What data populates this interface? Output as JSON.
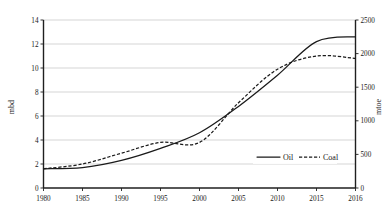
{
  "chart_data": {
    "type": "line",
    "title": "",
    "xlabel": "",
    "ylabel": "mbd",
    "y2label": "mtoe",
    "grid": true,
    "legend_position": "inside-right-lower",
    "x": [
      1980,
      1985,
      1990,
      1995,
      2000,
      2005,
      2010,
      2015,
      2016
    ],
    "xtick_labels": [
      "1980",
      "1985",
      "1990",
      "1995",
      "2000",
      "2005",
      "2010",
      "2015",
      "2016"
    ],
    "xlim": [
      1980,
      2016
    ],
    "ylim": [
      0,
      14
    ],
    "ytick_labels": [
      "0",
      "2",
      "4",
      "6",
      "8",
      "10",
      "12",
      "14"
    ],
    "ytick_values": [
      0,
      2,
      4,
      6,
      8,
      10,
      12,
      14
    ],
    "y2lim": [
      0,
      2500
    ],
    "y2tick_labels": [
      "0",
      "500",
      "1000",
      "1500",
      "2000",
      "2500"
    ],
    "y2tick_values": [
      0,
      500,
      1000,
      1500,
      2000,
      2500
    ],
    "series": [
      {
        "name": "Oil",
        "axis": "left",
        "unit": "mbd",
        "style": "solid",
        "color": "#1a1a1a",
        "x": [
          1980,
          1985,
          1990,
          1995,
          2000,
          2005,
          2010,
          2015,
          2016
        ],
        "values": [
          1.6,
          1.7,
          2.3,
          3.3,
          4.6,
          6.8,
          9.4,
          12.2,
          12.6
        ]
      },
      {
        "name": "Coal",
        "axis": "right",
        "unit": "mtoe",
        "style": "dashed",
        "color": "#1a1a1a",
        "x": [
          1980,
          1985,
          1990,
          1995,
          2000,
          2005,
          2010,
          2015,
          2016
        ],
        "values": [
          1.6,
          2.0,
          2.9,
          3.8,
          3.8,
          7.1,
          9.9,
          11.0,
          10.8
        ],
        "values_right_axis": [
          285,
          357,
          518,
          679,
          679,
          1268,
          1768,
          1964,
          1929
        ]
      }
    ]
  },
  "legend": {
    "items": [
      {
        "label": "Oil",
        "style": "solid"
      },
      {
        "label": "Coal",
        "style": "dashed"
      }
    ]
  },
  "axes": {
    "left_title": "mbd",
    "right_title": "mtoe"
  }
}
